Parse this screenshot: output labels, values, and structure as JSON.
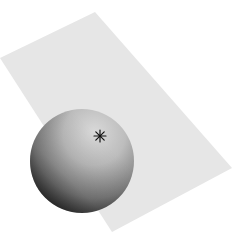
{
  "diagram": {
    "plane": {
      "points": [
        [
          95,
          12
        ],
        [
          232,
          168
        ],
        [
          112,
          232
        ],
        [
          0,
          58
        ]
      ],
      "fill": "#e6e6e6"
    },
    "sphere": {
      "cx": 82,
      "cy": 161,
      "r": 52,
      "highlight": "#d8d8d8",
      "shadow": "#1a1a1a"
    },
    "marker": {
      "x": 100,
      "y": 136,
      "glyph": "asterisk",
      "color": "#111111"
    }
  }
}
